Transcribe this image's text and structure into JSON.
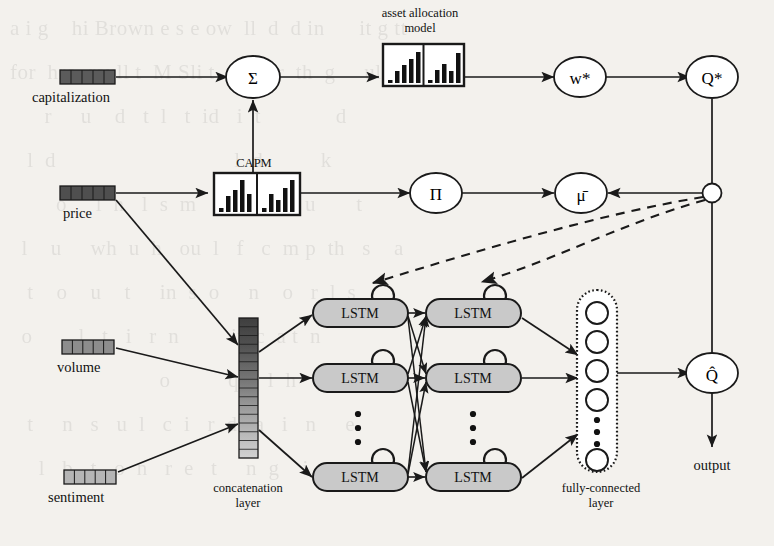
{
  "figure": {
    "type": "diagram",
    "background_color": "#f3f1ed",
    "ink_color": "#1a1a1a"
  },
  "inputs": [
    {
      "id": "capitalization",
      "label": "capitalization",
      "segments": 5,
      "shade": "#5b5b5b",
      "icon": "vector-bar-icon"
    },
    {
      "id": "price",
      "label": "price",
      "segments": 5,
      "shade": "#4f4f4f",
      "icon": "vector-bar-icon"
    },
    {
      "id": "volume",
      "label": "volume",
      "segments": 5,
      "shade": "#8d8d8d",
      "icon": "vector-bar-icon"
    },
    {
      "id": "sentiment",
      "label": "sentiment",
      "segments": 5,
      "shade": "#b5b5b5",
      "icon": "vector-bar-icon"
    }
  ],
  "nodes": {
    "sum": {
      "label": "Σ",
      "shape": "ellipse"
    },
    "w_star": {
      "label": "w*",
      "shape": "ellipse"
    },
    "q_star": {
      "label": "Q*",
      "shape": "ellipse"
    },
    "pi": {
      "label": "Π",
      "shape": "ellipse"
    },
    "mu_bar": {
      "label": "μ̄",
      "shape": "ellipse"
    },
    "q_hat": {
      "label": "Q̂",
      "shape": "ellipse"
    },
    "junction": {
      "label": "",
      "shape": "circle"
    }
  },
  "boxes": {
    "asset_allocation": {
      "caption_line1": "asset allocation",
      "caption_line2": "model",
      "icon": "bar-chart-icon",
      "panels": 2,
      "bars_left": [
        2,
        9,
        14,
        20,
        26
      ],
      "bars_right": [
        2,
        10,
        15,
        9,
        24
      ]
    },
    "capm": {
      "caption": "CAPM",
      "icon": "bar-chart-icon",
      "panels": 2,
      "bars_left": [
        3,
        12,
        18,
        25,
        14
      ],
      "bars_right": [
        3,
        14,
        9,
        19,
        25
      ]
    }
  },
  "concatenation": {
    "caption_line1": "concatenation",
    "caption_line2": "layer",
    "cells": 16,
    "shade_top": "#4a4a4a",
    "shade_bottom": "#cfcfcf"
  },
  "lstm": {
    "label": "LSTM",
    "fill": "#c9c9c9",
    "rows": 3,
    "columns": 2,
    "self_loop_icon": "recurrent-loop-icon",
    "vertical_dots": "⋮"
  },
  "fully_connected": {
    "caption_line1": "fully-connected",
    "caption_line2": "layer",
    "units_top": 4,
    "units_bottom": 1,
    "dots": 3,
    "border_style": "dotted"
  },
  "output": {
    "label": "output"
  },
  "edges": {
    "solid": "solid",
    "dashed": "dashed",
    "dashed_count": 2,
    "dashed_note": "feedback from junction to first LSTM column"
  },
  "ghost_text": "a i g    hi Brown e s e ow  ll  d  d in      it g tt\nfor  hro  raull t  M Sli t  w  l or  th  g     ul d un\n      r     u    d   t  l   t  id   i  t             d\n   l  d                               l  d          k\n        o     l  n   l  s  m   d     o       u       t\n  l    u     wh  u  h   ou  l   f   c  m p  th   s    a\n   t    o    u    t     in  s  o     n    o   r  l  s\n  o        l   t   i   r  n         it  c  a t  n\n                          o          q     l  h     o\n   t     n   s   u  l   c  i   r  d   a   i   n     e\n     l   b   t   o  n   r  e   t     n  g    i  t   u"
}
